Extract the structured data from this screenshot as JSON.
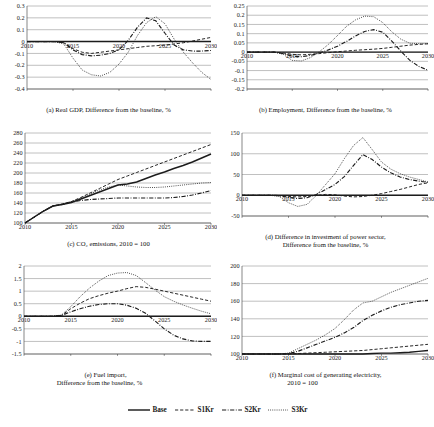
{
  "figure": {
    "title": "",
    "legend": {
      "position": "bottom-center",
      "items": [
        {
          "label": "Base",
          "style": "solid"
        },
        {
          "label": "S1Kr",
          "style": "dashed"
        },
        {
          "label": "S2Kr",
          "style": "dash-dot"
        },
        {
          "label": "S3Kr",
          "style": "dotted"
        }
      ]
    }
  },
  "chart_data": [
    {
      "id": "a",
      "type": "line",
      "title": "(a) Real GDP, Difference from the baseline, %",
      "caption_lines": [
        "(a) Real GDP, Difference from the baseline, %"
      ],
      "xlabel": "",
      "ylabel": "",
      "grid": true,
      "xlim": [
        2010,
        2030
      ],
      "ylim": [
        -0.4,
        0.3
      ],
      "xticks": [
        2010,
        2015,
        2020,
        2025,
        2030
      ],
      "xticklabels": [
        "2010",
        "2015",
        "2020",
        "2025",
        "2030"
      ],
      "yticks": [
        -0.4,
        -0.3,
        -0.2,
        -0.1,
        0,
        0.1,
        0.2,
        0.3
      ],
      "yticklabels": [
        "-0.4",
        "-0.3",
        "-0.2",
        "-0.1",
        "0",
        "0.1",
        "0.2",
        "0.3"
      ],
      "x": [
        2010,
        2011,
        2012,
        2013,
        2014,
        2015,
        2016,
        2017,
        2018,
        2019,
        2020,
        2021,
        2022,
        2023,
        2024,
        2025,
        2026,
        2027,
        2028,
        2029,
        2030
      ],
      "series": [
        {
          "name": "Base",
          "style": "solid",
          "values": [
            0,
            0,
            0,
            0,
            0,
            0,
            0,
            0,
            0,
            0,
            0,
            0,
            0,
            0,
            0,
            0,
            0,
            0,
            0,
            0,
            0
          ]
        },
        {
          "name": "S1Kr",
          "style": "dashed",
          "values": [
            0,
            0,
            0,
            0,
            -0.01,
            -0.06,
            -0.09,
            -0.1,
            -0.09,
            -0.08,
            -0.07,
            -0.06,
            -0.05,
            -0.04,
            -0.035,
            -0.03,
            -0.02,
            -0.01,
            0.005,
            0.02,
            0.035
          ]
        },
        {
          "name": "S2Kr",
          "style": "dash-dot",
          "values": [
            0,
            0,
            0,
            0,
            -0.01,
            -0.07,
            -0.11,
            -0.12,
            -0.115,
            -0.1,
            -0.07,
            0.01,
            0.12,
            0.2,
            0.175,
            0.07,
            -0.03,
            -0.07,
            -0.08,
            -0.08,
            -0.075
          ]
        },
        {
          "name": "S3Kr",
          "style": "dotted",
          "values": [
            0,
            0,
            0,
            0,
            -0.02,
            -0.14,
            -0.24,
            -0.28,
            -0.29,
            -0.26,
            -0.19,
            -0.09,
            0.05,
            0.16,
            0.21,
            0.15,
            0.02,
            -0.09,
            -0.18,
            -0.26,
            -0.32
          ]
        }
      ]
    },
    {
      "id": "b",
      "type": "line",
      "title": "(b) Employment, Difference from the baseline, %",
      "caption_lines": [
        "(b) Employment, Difference from the baseline, %"
      ],
      "xlabel": "",
      "ylabel": "",
      "grid": true,
      "xlim": [
        2010,
        2030
      ],
      "ylim": [
        -0.2,
        0.25
      ],
      "xticks": [
        2010,
        2015,
        2020,
        2025,
        2030
      ],
      "xticklabels": [
        "2010",
        "2015",
        "2020",
        "2025",
        "2030"
      ],
      "yticks": [
        -0.2,
        -0.15,
        -0.1,
        -0.05,
        0,
        0.05,
        0.1,
        0.15,
        0.2,
        0.25
      ],
      "yticklabels": [
        "-0.2",
        "-0.15",
        "-0.1",
        "-0.05",
        "0",
        "0.05",
        "0.1",
        "0.15",
        "0.2",
        "0.25"
      ],
      "x": [
        2010,
        2011,
        2012,
        2013,
        2014,
        2015,
        2016,
        2017,
        2018,
        2019,
        2020,
        2021,
        2022,
        2023,
        2024,
        2025,
        2026,
        2027,
        2028,
        2029,
        2030
      ],
      "series": [
        {
          "name": "Base",
          "style": "solid",
          "values": [
            0,
            0,
            0,
            0,
            0,
            0,
            0,
            0,
            0,
            0,
            0,
            0,
            0,
            0,
            0,
            0,
            0,
            0,
            0,
            0,
            0
          ]
        },
        {
          "name": "S1Kr",
          "style": "dashed",
          "values": [
            0,
            0,
            0,
            0,
            -0.005,
            -0.012,
            -0.015,
            -0.012,
            -0.008,
            -0.003,
            0.002,
            0.006,
            0.01,
            0.013,
            0.016,
            0.02,
            0.026,
            0.032,
            0.038,
            0.042,
            0.045
          ]
        },
        {
          "name": "S2Kr",
          "style": "dash-dot",
          "values": [
            0,
            0,
            0,
            0,
            -0.008,
            -0.022,
            -0.025,
            -0.018,
            -0.005,
            0.012,
            0.032,
            0.058,
            0.088,
            0.112,
            0.122,
            0.108,
            0.06,
            0.005,
            -0.045,
            -0.078,
            -0.098
          ]
        },
        {
          "name": "S3Kr",
          "style": "dotted",
          "values": [
            0,
            0,
            0,
            0,
            -0.012,
            -0.045,
            -0.048,
            -0.03,
            0.002,
            0.042,
            0.09,
            0.14,
            0.175,
            0.195,
            0.192,
            0.16,
            0.11,
            0.07,
            0.048,
            0.046,
            0.046
          ]
        }
      ]
    },
    {
      "id": "c",
      "type": "line",
      "title": "(c) CO2 emissions, 2010 = 100",
      "caption_lines": [
        "(c) CO₂ emissions,  2010 = 100"
      ],
      "xlabel": "",
      "ylabel": "",
      "grid": true,
      "xlim": [
        2010,
        2030
      ],
      "ylim": [
        100,
        280
      ],
      "xticks": [
        2010,
        2015,
        2020,
        2025,
        2030
      ],
      "xticklabels": [
        "2010",
        "2015",
        "2020",
        "2025",
        "2030"
      ],
      "yticks": [
        100,
        120,
        140,
        160,
        180,
        200,
        220,
        240,
        260,
        280
      ],
      "yticklabels": [
        "100",
        "120",
        "140",
        "160",
        "180",
        "200",
        "220",
        "240",
        "260",
        "280"
      ],
      "x": [
        2010,
        2011,
        2012,
        2013,
        2014,
        2015,
        2016,
        2017,
        2018,
        2019,
        2020,
        2021,
        2022,
        2023,
        2024,
        2025,
        2026,
        2027,
        2028,
        2029,
        2030
      ],
      "series": [
        {
          "name": "Base",
          "style": "solid",
          "values": [
            100,
            112,
            124,
            134,
            137,
            141,
            148,
            155,
            162,
            169,
            176,
            178,
            182,
            189,
            196,
            202,
            209,
            215,
            222,
            230,
            238
          ]
        },
        {
          "name": "S1Kr",
          "style": "dashed",
          "values": [
            100,
            112,
            124,
            134,
            138,
            143,
            151,
            160,
            169,
            178,
            187,
            194,
            201,
            208,
            215,
            222,
            229,
            236,
            243,
            250,
            257
          ]
        },
        {
          "name": "S2Kr",
          "style": "dash-dot",
          "values": [
            100,
            112,
            124,
            134,
            137,
            142,
            145,
            147,
            148,
            149,
            150,
            150,
            150,
            150,
            150,
            150,
            151,
            153,
            156,
            160,
            165
          ]
        },
        {
          "name": "S3Kr",
          "style": "dotted",
          "values": [
            100,
            112,
            124,
            134,
            138,
            143,
            150,
            158,
            166,
            172,
            176,
            174,
            172,
            171,
            171,
            172,
            174,
            176,
            178,
            180,
            181
          ]
        }
      ]
    },
    {
      "id": "d",
      "type": "line",
      "title": "(d) Difference in investment of power sector, Difference from the baseline, %",
      "caption_lines": [
        "(d) Difference in investment of power sector,",
        "Difference from the baseline,  %"
      ],
      "xlabel": "",
      "ylabel": "",
      "grid": true,
      "xlim": [
        2010,
        2030
      ],
      "ylim": [
        -50,
        150
      ],
      "xticks": [
        2010,
        2015,
        2020,
        2025,
        2030
      ],
      "xticklabels": [
        "2010",
        "2015",
        "2020",
        "2025",
        "2030"
      ],
      "yticks": [
        -50,
        0,
        50,
        100,
        150
      ],
      "yticklabels": [
        "-50",
        "0",
        "50",
        "100",
        "150"
      ],
      "x": [
        2010,
        2011,
        2012,
        2013,
        2014,
        2015,
        2016,
        2017,
        2018,
        2019,
        2020,
        2021,
        2022,
        2023,
        2024,
        2025,
        2026,
        2027,
        2028,
        2029,
        2030
      ],
      "series": [
        {
          "name": "Base",
          "style": "solid",
          "values": [
            0,
            0,
            0,
            0,
            0,
            0,
            0,
            0,
            0,
            0,
            0,
            0,
            0,
            0,
            0,
            0,
            0,
            0,
            0,
            0,
            0
          ]
        },
        {
          "name": "S1Kr",
          "style": "dashed",
          "values": [
            0,
            0,
            0,
            0,
            -1,
            -3,
            -4,
            -3,
            0,
            2,
            1,
            -2,
            -4,
            -3,
            0,
            4,
            9,
            14,
            20,
            26,
            30
          ]
        },
        {
          "name": "S2Kr",
          "style": "dash-dot",
          "values": [
            0,
            0,
            0,
            0,
            -1,
            -5,
            -8,
            -6,
            2,
            14,
            26,
            45,
            72,
            98,
            86,
            68,
            54,
            44,
            38,
            34,
            31
          ]
        },
        {
          "name": "S3Kr",
          "style": "dotted",
          "values": [
            0,
            0,
            0,
            0,
            -3,
            -18,
            -27,
            -22,
            0,
            26,
            52,
            88,
            120,
            139,
            110,
            80,
            63,
            52,
            44,
            38,
            32
          ]
        }
      ]
    },
    {
      "id": "e",
      "type": "line",
      "title": "(e) Fuel import, Difference from the baseline, %",
      "caption_lines": [
        "(e) Fuel import,",
        "Difference from the baseline,  %"
      ],
      "xlabel": "",
      "ylabel": "",
      "grid": true,
      "xlim": [
        2010,
        2030
      ],
      "ylim": [
        -1.5,
        2
      ],
      "xticks": [
        2010,
        2015,
        2020,
        2025,
        2030
      ],
      "xticklabels": [
        "2010",
        "2015",
        "2020",
        "2025",
        "2030"
      ],
      "yticks": [
        -1.5,
        -1,
        -0.5,
        0,
        0.5,
        1,
        1.5,
        2
      ],
      "yticklabels": [
        "-1.5",
        "-1",
        "-0.5",
        "0",
        "0.5",
        "1",
        "1.5",
        "2"
      ],
      "x": [
        2010,
        2011,
        2012,
        2013,
        2014,
        2015,
        2016,
        2017,
        2018,
        2019,
        2020,
        2021,
        2022,
        2023,
        2024,
        2025,
        2026,
        2027,
        2028,
        2029,
        2030
      ],
      "series": [
        {
          "name": "Base",
          "style": "solid",
          "values": [
            0,
            0,
            0,
            0,
            0,
            0,
            0,
            0,
            0,
            0,
            0,
            0,
            0,
            0,
            0,
            0,
            0,
            0,
            0,
            0,
            0
          ]
        },
        {
          "name": "S1Kr",
          "style": "dashed",
          "values": [
            0,
            0,
            0,
            0,
            0.03,
            0.3,
            0.52,
            0.7,
            0.82,
            0.92,
            1.0,
            1.1,
            1.18,
            1.15,
            1.08,
            1.0,
            0.92,
            0.84,
            0.76,
            0.68,
            0.6
          ]
        },
        {
          "name": "S2Kr",
          "style": "dash-dot",
          "values": [
            0,
            0,
            0,
            0,
            0.03,
            0.18,
            0.3,
            0.4,
            0.47,
            0.5,
            0.5,
            0.44,
            0.32,
            0.12,
            -0.18,
            -0.5,
            -0.75,
            -0.9,
            -0.98,
            -1.0,
            -1.0
          ]
        },
        {
          "name": "S3Kr",
          "style": "dotted",
          "values": [
            0,
            0,
            0,
            0,
            0.05,
            0.38,
            0.78,
            1.12,
            1.4,
            1.62,
            1.72,
            1.74,
            1.62,
            1.34,
            1.05,
            0.78,
            0.6,
            0.45,
            0.32,
            0.2,
            0.1
          ]
        }
      ]
    },
    {
      "id": "f",
      "type": "line",
      "title": "(f) Marginal cost of generating electricity, 2010 = 100",
      "caption_lines": [
        "(f) Marginal cost of generating electricity,",
        "2010 = 100"
      ],
      "xlabel": "",
      "ylabel": "",
      "grid": true,
      "xlim": [
        2010,
        2030
      ],
      "ylim": [
        100,
        200
      ],
      "xticks": [
        2010,
        2015,
        2020,
        2025,
        2030
      ],
      "xticklabels": [
        "2010",
        "2015",
        "2020",
        "2025",
        "2030"
      ],
      "yticks": [
        100,
        120,
        140,
        160,
        180,
        200
      ],
      "yticklabels": [
        "100",
        "120",
        "140",
        "160",
        "180",
        "200"
      ],
      "x": [
        2010,
        2011,
        2012,
        2013,
        2014,
        2015,
        2016,
        2017,
        2018,
        2019,
        2020,
        2021,
        2022,
        2023,
        2024,
        2025,
        2026,
        2027,
        2028,
        2029,
        2030
      ],
      "series": [
        {
          "name": "Base",
          "style": "solid",
          "values": [
            100,
            100,
            100,
            100,
            100,
            100,
            100,
            100,
            100,
            100,
            100,
            100,
            100,
            100,
            100.5,
            101,
            101,
            101.5,
            102,
            103,
            104
          ]
        },
        {
          "name": "S1Kr",
          "style": "dashed",
          "values": [
            100,
            100,
            100,
            100,
            100,
            100,
            100.5,
            101,
            101.5,
            102,
            102.5,
            103,
            103.5,
            104,
            105,
            106,
            107,
            108,
            109,
            110,
            111
          ]
        },
        {
          "name": "S2Kr",
          "style": "dash-dot",
          "values": [
            100,
            100,
            100,
            100,
            100,
            100.5,
            103,
            107,
            111,
            115,
            119,
            124,
            130,
            138,
            144,
            149,
            153,
            156,
            158,
            160,
            161
          ]
        },
        {
          "name": "S3Kr",
          "style": "dotted",
          "values": [
            100,
            100,
            100,
            100,
            100,
            101,
            106,
            111,
            116,
            122,
            129,
            139,
            150,
            158,
            160,
            165,
            170,
            174,
            178,
            182,
            186
          ]
        }
      ]
    }
  ]
}
